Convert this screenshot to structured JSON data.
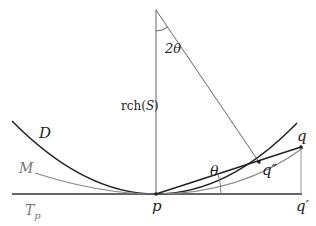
{
  "figure": {
    "labels": {
      "two_theta": "2θ",
      "reach": "rch(",
      "reach_set": "S",
      "reach_close": ")",
      "D": "D",
      "M": "M",
      "Tp": "T",
      "Tp_sub": "p",
      "p": "p",
      "theta": "θ",
      "q": "q",
      "q_double_prime": "q″",
      "q_prime": "q′"
    },
    "colors": {
      "dark": "#222222",
      "gray": "#888888",
      "light": "#999999"
    }
  }
}
